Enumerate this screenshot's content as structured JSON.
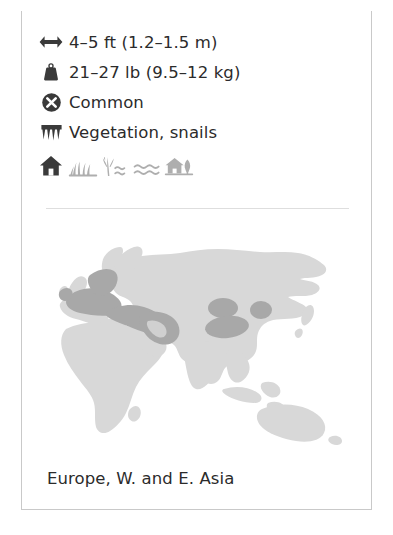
{
  "card": {
    "facts": [
      {
        "icon": "length-arrows-icon",
        "name": "fact-length",
        "value": "4–5 ft (1.2–1.5 m)"
      },
      {
        "icon": "weight-icon",
        "name": "fact-weight",
        "value": "21–27 lb (9.5–12 kg)"
      },
      {
        "icon": "status-circle-x-icon",
        "name": "fact-conservation-status",
        "value": "Common"
      },
      {
        "icon": "teeth-icon",
        "name": "fact-diet",
        "value": "Vegetation, snails"
      }
    ],
    "habitat": {
      "label_icon": "house-icon",
      "icons": [
        "house-icon",
        "marsh-grass-icon",
        "reeds-water-icon",
        "open-water-waves-icon",
        "village-tree-icon"
      ]
    },
    "map": {
      "name": "range-map-eurasia",
      "caption": "Europe, W. and E. Asia",
      "land_color": "#d8d8d8",
      "range_color": "#a8a8a8",
      "background_color": "#ffffff"
    },
    "colors": {
      "top_bar": "#9d9d9d",
      "border": "#c9c9c9",
      "divider": "#dedede",
      "icon_dark": "#3a3a3a",
      "icon_muted": "#aeaeae",
      "text": "#2b2b2b"
    }
  }
}
